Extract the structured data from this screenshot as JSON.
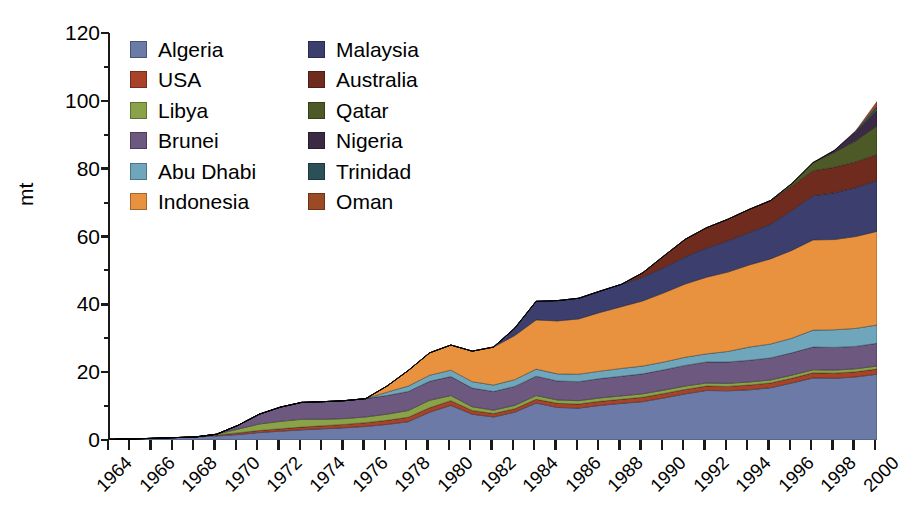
{
  "chart_data": {
    "type": "area",
    "stacked": true,
    "title": "",
    "subtitle": "",
    "xlabel": "",
    "ylabel": "mt",
    "ylim": [
      0,
      120
    ],
    "yticks": [
      0,
      20,
      40,
      60,
      80,
      100,
      120
    ],
    "ytick_labels": [
      "0",
      "20",
      "40",
      "60",
      "80",
      "100",
      "120"
    ],
    "grid": false,
    "legend_position": "top-left",
    "x": [
      1964,
      1965,
      1966,
      1967,
      1968,
      1969,
      1970,
      1971,
      1972,
      1973,
      1974,
      1975,
      1976,
      1977,
      1978,
      1979,
      1980,
      1981,
      1982,
      1983,
      1984,
      1985,
      1986,
      1987,
      1988,
      1989,
      1990,
      1991,
      1992,
      1993,
      1994,
      1995,
      1996,
      1997,
      1998,
      1999,
      2000
    ],
    "xtick_labels": [
      "1964",
      "1966",
      "1968",
      "1970",
      "1972",
      "1974",
      "1976",
      "1978",
      "1980",
      "1982",
      "1984",
      "1986",
      "1988",
      "1990",
      "1992",
      "1994",
      "1996",
      "1998",
      "2000"
    ],
    "series": [
      {
        "name": "Algeria",
        "color": "#6b7aa6",
        "values": [
          0.1,
          0.3,
          0.5,
          0.7,
          0.9,
          1.2,
          1.6,
          2.2,
          2.6,
          3.0,
          3.3,
          3.6,
          4.0,
          4.6,
          5.4,
          8.2,
          10.2,
          7.6,
          6.8,
          8.2,
          10.9,
          9.6,
          9.4,
          10.2,
          10.8,
          11.3,
          12.4,
          13.6,
          14.6,
          14.5,
          14.8,
          15.4,
          16.8,
          18.3,
          18.2,
          18.6,
          19.4
        ]
      },
      {
        "name": "USA",
        "color": "#a8432a",
        "values": [
          0.0,
          0.0,
          0.0,
          0.0,
          0.0,
          0.3,
          0.5,
          0.6,
          0.7,
          0.8,
          0.9,
          1.0,
          1.1,
          1.2,
          1.3,
          1.3,
          1.4,
          1.1,
          1.0,
          1.0,
          1.1,
          1.2,
          1.2,
          1.2,
          1.2,
          1.3,
          1.3,
          1.3,
          1.3,
          1.3,
          1.4,
          1.4,
          1.4,
          1.5,
          1.5,
          1.5,
          1.5
        ]
      },
      {
        "name": "Libya",
        "color": "#8aa349",
        "values": [
          0.0,
          0.0,
          0.0,
          0.0,
          0.0,
          0.2,
          1.1,
          1.9,
          2.2,
          2.3,
          1.9,
          1.7,
          1.7,
          1.8,
          2.0,
          2.2,
          1.5,
          1.1,
          1.0,
          1.0,
          1.1,
          1.0,
          1.0,
          1.0,
          1.0,
          1.0,
          1.0,
          1.0,
          0.9,
          0.9,
          0.9,
          0.9,
          0.9,
          0.9,
          0.9,
          0.9,
          0.9
        ]
      },
      {
        "name": "Brunei",
        "color": "#6d5880",
        "values": [
          0.0,
          0.0,
          0.0,
          0.0,
          0.0,
          0.0,
          1.1,
          2.9,
          4.2,
          5.0,
          5.2,
          5.3,
          5.4,
          5.5,
          5.6,
          5.6,
          5.6,
          5.5,
          5.5,
          5.6,
          5.7,
          5.6,
          5.6,
          5.7,
          5.8,
          5.9,
          6.0,
          6.1,
          6.2,
          6.3,
          6.4,
          6.5,
          6.6,
          6.7,
          6.7,
          6.6,
          6.7
        ]
      },
      {
        "name": "Abu Dhabi",
        "color": "#6fa6bb",
        "values": [
          0.0,
          0.0,
          0.0,
          0.0,
          0.0,
          0.0,
          0.0,
          0.0,
          0.0,
          0.0,
          0.0,
          0.0,
          0.0,
          1.0,
          1.6,
          1.8,
          1.9,
          1.9,
          1.9,
          2.0,
          2.1,
          2.1,
          2.2,
          2.2,
          2.3,
          2.3,
          2.3,
          2.4,
          2.4,
          3.1,
          3.9,
          4.1,
          4.3,
          5.0,
          5.2,
          5.3,
          5.4
        ]
      },
      {
        "name": "Indonesia",
        "color": "#e8923f",
        "values": [
          0.0,
          0.0,
          0.0,
          0.0,
          0.0,
          0.0,
          0.0,
          0.0,
          0.0,
          0.0,
          0.0,
          0.0,
          0.0,
          1.8,
          4.6,
          6.6,
          7.4,
          9.0,
          11.2,
          13.0,
          14.5,
          15.6,
          16.3,
          17.3,
          18.2,
          19.2,
          20.4,
          21.6,
          22.6,
          23.4,
          24.2,
          25.1,
          25.9,
          26.6,
          26.6,
          27.1,
          27.6
        ]
      },
      {
        "name": "Malaysia",
        "color": "#3c3f6e",
        "values": [
          0.0,
          0.0,
          0.0,
          0.0,
          0.0,
          0.0,
          0.0,
          0.0,
          0.0,
          0.0,
          0.0,
          0.0,
          0.0,
          0.0,
          0.0,
          0.0,
          0.0,
          0.0,
          0.0,
          2.2,
          5.5,
          6.0,
          6.1,
          6.3,
          6.6,
          7.0,
          7.4,
          8.0,
          8.6,
          9.2,
          9.6,
          10.2,
          11.8,
          13.0,
          13.8,
          14.4,
          15.0
        ]
      },
      {
        "name": "Australia",
        "color": "#6e2b1e",
        "values": [
          0.0,
          0.0,
          0.0,
          0.0,
          0.0,
          0.0,
          0.0,
          0.0,
          0.0,
          0.0,
          0.0,
          0.0,
          0.0,
          0.0,
          0.0,
          0.0,
          0.0,
          0.0,
          0.0,
          0.0,
          0.0,
          0.0,
          0.0,
          0.0,
          0.0,
          1.3,
          3.5,
          5.2,
          6.0,
          6.4,
          6.8,
          7.0,
          7.2,
          7.4,
          7.5,
          7.6,
          7.7
        ]
      },
      {
        "name": "Qatar",
        "color": "#4d5a28",
        "values": [
          0.0,
          0.0,
          0.0,
          0.0,
          0.0,
          0.0,
          0.0,
          0.0,
          0.0,
          0.0,
          0.0,
          0.0,
          0.0,
          0.0,
          0.0,
          0.0,
          0.0,
          0.0,
          0.0,
          0.0,
          0.0,
          0.0,
          0.0,
          0.0,
          0.0,
          0.0,
          0.0,
          0.0,
          0.0,
          0.0,
          0.0,
          0.0,
          0.7,
          2.4,
          4.4,
          6.2,
          8.4
        ]
      },
      {
        "name": "Nigeria",
        "color": "#3a2a44",
        "values": [
          0.0,
          0.0,
          0.0,
          0.0,
          0.0,
          0.0,
          0.0,
          0.0,
          0.0,
          0.0,
          0.0,
          0.0,
          0.0,
          0.0,
          0.0,
          0.0,
          0.0,
          0.0,
          0.0,
          0.0,
          0.0,
          0.0,
          0.0,
          0.0,
          0.0,
          0.0,
          0.0,
          0.0,
          0.0,
          0.0,
          0.0,
          0.0,
          0.0,
          0.0,
          0.6,
          2.6,
          4.6
        ]
      },
      {
        "name": "Trinidad",
        "color": "#2c5058",
        "values": [
          0.0,
          0.0,
          0.0,
          0.0,
          0.0,
          0.0,
          0.0,
          0.0,
          0.0,
          0.0,
          0.0,
          0.0,
          0.0,
          0.0,
          0.0,
          0.0,
          0.0,
          0.0,
          0.0,
          0.0,
          0.0,
          0.0,
          0.0,
          0.0,
          0.0,
          0.0,
          0.0,
          0.0,
          0.0,
          0.0,
          0.0,
          0.0,
          0.0,
          0.0,
          0.0,
          0.2,
          1.2
        ]
      },
      {
        "name": "Oman",
        "color": "#9a4a24",
        "values": [
          0.0,
          0.0,
          0.0,
          0.0,
          0.0,
          0.0,
          0.0,
          0.0,
          0.0,
          0.0,
          0.0,
          0.0,
          0.0,
          0.0,
          0.0,
          0.0,
          0.0,
          0.0,
          0.0,
          0.0,
          0.0,
          0.0,
          0.0,
          0.0,
          0.0,
          0.0,
          0.0,
          0.0,
          0.0,
          0.0,
          0.0,
          0.0,
          0.0,
          0.0,
          0.0,
          0.2,
          1.4
        ]
      }
    ]
  },
  "axes": {
    "y_title": "mt"
  },
  "legend": {
    "columns": [
      [
        "Algeria",
        "USA",
        "Libya",
        "Brunei",
        "Abu Dhabi",
        "Indonesia"
      ],
      [
        "Malaysia",
        "Australia",
        "Qatar",
        "Nigeria",
        "Trinidad",
        "Oman"
      ]
    ]
  }
}
